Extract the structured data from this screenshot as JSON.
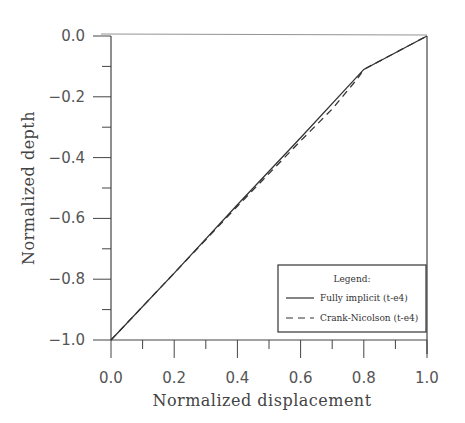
{
  "chart_data": {
    "type": "line",
    "title": "",
    "xlabel": "Normalized displacement",
    "ylabel": "Normalized depth",
    "xlim": [
      0.0,
      1.0
    ],
    "ylim": [
      -1.0,
      0.0
    ],
    "xticks": [
      0.0,
      0.2,
      0.4,
      0.6,
      0.8,
      1.0
    ],
    "xtick_labels": [
      "0.0",
      "0.2",
      "0.4",
      "0.6",
      "0.8",
      "1.0"
    ],
    "yticks": [
      0.0,
      -0.2,
      -0.4,
      -0.6,
      -0.8,
      -1.0
    ],
    "ytick_labels": [
      "0.0",
      "-0.2",
      "-0.4",
      "-0.6",
      "-0.8",
      "-1.0"
    ],
    "x_minor_step": 0.1,
    "y_minor_step": 0.1,
    "grid": false,
    "legend": {
      "title": "Legend:",
      "position": "bottom-right",
      "entries": [
        "Fully implicit (t-e4)",
        "Crank-Nicolson (t-e4)"
      ]
    },
    "series": [
      {
        "name": "Fully implicit (t-e4)",
        "style": "solid",
        "x": [
          0.0,
          0.2,
          0.4,
          0.6,
          0.8,
          0.9,
          1.0
        ],
        "y": [
          -1.0,
          -0.78,
          -0.555,
          -0.335,
          -0.11,
          -0.055,
          0.0
        ]
      },
      {
        "name": "Crank-Nicolson (t-e4)",
        "style": "dashed",
        "x": [
          0.0,
          0.2,
          0.4,
          0.6,
          0.7,
          0.78,
          0.8,
          0.9,
          1.0
        ],
        "y": [
          -1.0,
          -0.78,
          -0.56,
          -0.345,
          -0.24,
          -0.14,
          -0.11,
          -0.055,
          0.0
        ]
      }
    ]
  }
}
